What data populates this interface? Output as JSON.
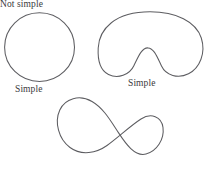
{
  "figure": {
    "width": 208,
    "height": 173,
    "background_color": "#ffffff",
    "stroke_color": "#5d5d61",
    "text_color": "#3a3a3c",
    "shapes": [
      {
        "id": "circle",
        "name": "closed-circle-curve",
        "caption": "Simple",
        "classification": "simple",
        "description": "closed circular curve that does not intersect itself"
      },
      {
        "id": "bean",
        "name": "kidney-bean-curve",
        "caption": "Simple",
        "classification": "simple",
        "description": "closed concave bean shaped curve that does not intersect itself"
      },
      {
        "id": "figure-eight",
        "name": "figure-eight-curve",
        "caption": "Not simple",
        "classification": "not simple",
        "description": "closed curve crossing itself once forming two lobes"
      }
    ]
  },
  "captions": {
    "circle": "Simple",
    "bean": "Simple",
    "figure_eight": "Not simple"
  }
}
